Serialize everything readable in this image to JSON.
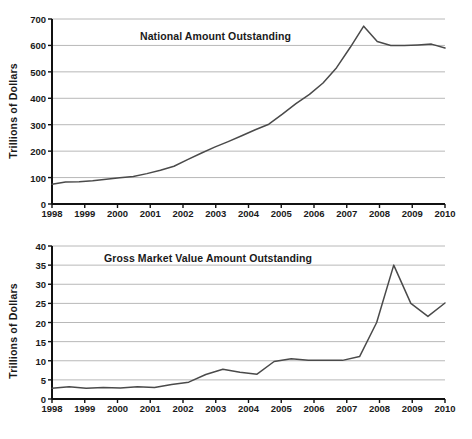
{
  "figure": {
    "ylabel": "Trillions of Dollars",
    "axis_color": "#111111",
    "grid_color": "#b8b8b8",
    "line_color": "#4a4a4a",
    "background": "#ffffff"
  },
  "chart_data": [
    {
      "type": "line",
      "title": "National Amount Outstanding",
      "xlabel": "",
      "ylabel": "Trillions of Dollars",
      "xlim": [
        1998,
        2010
      ],
      "ylim": [
        0,
        700
      ],
      "ytick_step": 100,
      "yticks": [
        0,
        100,
        200,
        300,
        400,
        500,
        600,
        700
      ],
      "xticks": [
        1998,
        1999,
        2000,
        2001,
        2002,
        2003,
        2004,
        2005,
        2006,
        2007,
        2008,
        2009,
        2010
      ],
      "grid": true,
      "grid_axis": "y",
      "legend": "none",
      "series": [
        {
          "name": "National Amount Outstanding",
          "x": [
            1998,
            1998.5,
            1999,
            1999.5,
            2000,
            2000.5,
            2001,
            2001.5,
            2002,
            2002.5,
            2003,
            2003.5,
            2004,
            2004.5,
            2005,
            2005.5,
            2006,
            2006.5,
            2007,
            2007.5,
            2008,
            2008.5,
            2009,
            2009.5,
            2010
          ],
          "values": [
            75,
            83,
            84,
            88,
            94,
            99,
            104,
            115,
            128,
            143,
            168,
            192,
            215,
            236,
            258,
            281,
            302,
            340,
            380,
            415,
            458,
            516,
            592,
            673,
            615,
            600,
            600,
            602,
            605,
            590
          ]
        }
      ]
    },
    {
      "type": "line",
      "title": "Gross Market Value Amount Outstanding",
      "xlabel": "",
      "ylabel": "Trillions of Dollars",
      "xlim": [
        1998,
        2010
      ],
      "ylim": [
        0,
        40
      ],
      "ytick_step": 5,
      "yticks": [
        0,
        5,
        10,
        15,
        20,
        25,
        30,
        35,
        40
      ],
      "xticks": [
        1998,
        1999,
        2000,
        2001,
        2002,
        2003,
        2004,
        2005,
        2006,
        2007,
        2008,
        2009,
        2010
      ],
      "grid": true,
      "grid_axis": "y",
      "legend": "none",
      "series": [
        {
          "name": "Gross Market Value Amount Outstanding",
          "x": [
            1998,
            1998.5,
            1999,
            1999.5,
            2000,
            2000.5,
            2001,
            2001.5,
            2002,
            2002.5,
            2003,
            2003.5,
            2004,
            2004.5,
            2005,
            2005.5,
            2006,
            2006.5,
            2007,
            2007.5,
            2008,
            2008.5,
            2009,
            2009.5,
            2010
          ],
          "values": [
            2.8,
            3.2,
            2.8,
            3.0,
            2.9,
            3.2,
            3.0,
            3.8,
            4.4,
            6.4,
            7.8,
            7.0,
            6.5,
            9.8,
            10.5,
            10.1,
            10.1,
            10.1,
            11.1,
            20.0,
            35.0,
            25.0,
            21.6,
            25.1
          ]
        }
      ]
    }
  ],
  "charts": [
    {
      "id": "national-amount-outstanding",
      "title": "National Amount Outstanding",
      "ylabel": "Trillions of Dollars",
      "ytick_labels": [
        "700",
        "600",
        "500",
        "400",
        "300",
        "200",
        "100",
        "0"
      ],
      "xtick_labels": [
        "1998",
        "1999",
        "2000",
        "2001",
        "2002",
        "2003",
        "2004",
        "2005",
        "2006",
        "2007",
        "2008",
        "2009",
        "2010"
      ]
    },
    {
      "id": "gross-market-value-amount-outstanding",
      "title": "Gross Market Value Amount Outstanding",
      "ylabel": "Trillions of Dollars",
      "ytick_labels": [
        "40",
        "35",
        "30",
        "25",
        "20",
        "15",
        "10",
        "5",
        "0"
      ],
      "xtick_labels": [
        "1998",
        "1999",
        "2000",
        "2001",
        "2002",
        "2003",
        "2004",
        "2005",
        "2006",
        "2007",
        "2008",
        "2009",
        "2010"
      ]
    }
  ]
}
